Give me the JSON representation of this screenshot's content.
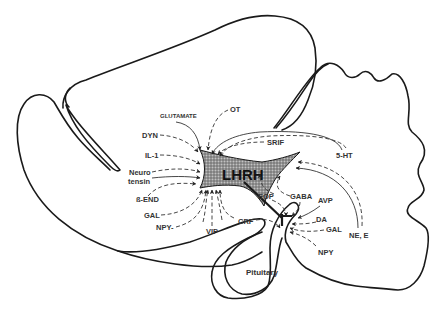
{
  "diagram": {
    "title": "LHRH",
    "center_label": "LHRH",
    "structure_label": "Pituitary",
    "colors": {
      "outline": "#1a1a1a",
      "text": "#333333",
      "lhrh_fill": "#8a8a8a",
      "background": "#ffffff"
    },
    "inputs_left": [
      {
        "label": "GLUTAMATE",
        "line": "solid"
      },
      {
        "label": "DYN",
        "line": "dashed"
      },
      {
        "label": "IL-1",
        "line": "dashed"
      },
      {
        "label": "Neuro",
        "label2": "tensin",
        "line": "solid+dashed"
      },
      {
        "label": "ß-END",
        "line": "dashed"
      },
      {
        "label": "GAL",
        "line": "dashed"
      },
      {
        "label": "NPY-",
        "line": "dashed"
      },
      {
        "label": "VIP",
        "line": "dashed"
      }
    ],
    "inputs_top": [
      {
        "label": "OT",
        "line": "dashed"
      }
    ],
    "inputs_right": [
      {
        "label": "SRIF",
        "line": "dashed"
      },
      {
        "label": "5-HT",
        "line": "solid+dashed"
      },
      {
        "label": "NE, E",
        "line": "solid+dashed"
      }
    ],
    "inputs_median_eminence": [
      {
        "label": "EOP",
        "line": "dashed"
      },
      {
        "label": "GABA",
        "line": "dashed"
      },
      {
        "label": "AVP",
        "line": "solid"
      },
      {
        "label": "DA",
        "line": "dashed"
      },
      {
        "label": "GAL",
        "line": "dashed"
      },
      {
        "label": "NPY",
        "line": "dashed"
      },
      {
        "label": "CRF",
        "line": "dashed"
      }
    ]
  }
}
